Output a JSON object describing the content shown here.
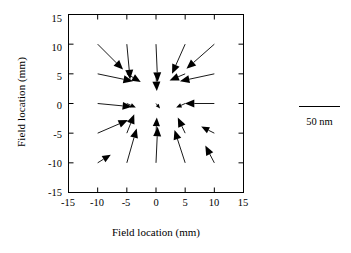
{
  "figure": {
    "xlabel": "Field location (mm)",
    "ylabel": "Field location (mm)",
    "legend_label": "50 nm",
    "frame_color": "#000000",
    "arrow_color": "#000000"
  },
  "chart_data": {
    "type": "scatter",
    "plot_kind": "quiver",
    "title": "",
    "xlabel": "Field location (mm)",
    "ylabel": "Field location (mm)",
    "xlim": [
      -15,
      15
    ],
    "ylim": [
      -15,
      15
    ],
    "xticks": [
      -15,
      -10,
      -5,
      0,
      5,
      10,
      15
    ],
    "yticks": [
      -15,
      -10,
      -5,
      0,
      5,
      10,
      15
    ],
    "xticklabels": [
      "-15",
      "-10",
      "-5",
      "0",
      "5",
      "10",
      "15"
    ],
    "yticklabels": [
      "-15",
      "-10",
      "-5",
      "0",
      "5",
      "10",
      "15"
    ],
    "grid": false,
    "legend": {
      "label": "50 nm",
      "value": 50,
      "unit": "nm",
      "position": "right-outside"
    },
    "vector_units": "nm",
    "vectors": [
      {
        "x": -10,
        "y": 10,
        "u": 3.1,
        "v": -3.1
      },
      {
        "x": -5,
        "y": 10,
        "u": 0.4,
        "v": -4.3
      },
      {
        "x": 0,
        "y": 10,
        "u": 0.2,
        "v": -4.6
      },
      {
        "x": 5,
        "y": 10,
        "u": -1.6,
        "v": -3.6
      },
      {
        "x": 10,
        "y": 10,
        "u": -3.4,
        "v": -3.0
      },
      {
        "x": -10,
        "y": 5,
        "u": 4.3,
        "v": -0.9
      },
      {
        "x": -5,
        "y": 5,
        "u": 1.7,
        "v": -1.0
      },
      {
        "x": 0,
        "y": 5,
        "u": 0.1,
        "v": -2.1
      },
      {
        "x": 5,
        "y": 5,
        "u": -1.9,
        "v": -0.8
      },
      {
        "x": 10,
        "y": 5,
        "u": -4.2,
        "v": -0.9
      },
      {
        "x": -10,
        "y": 0,
        "u": 4.2,
        "v": -0.4
      },
      {
        "x": -5,
        "y": 0,
        "u": 1.1,
        "v": -0.5
      },
      {
        "x": 0,
        "y": 0,
        "u": 0.5,
        "v": -0.6
      },
      {
        "x": 5,
        "y": 0,
        "u": -1.1,
        "v": -0.5
      },
      {
        "x": 10,
        "y": 0,
        "u": -3.6,
        "v": 0.0
      },
      {
        "x": -10,
        "y": -5,
        "u": 3.7,
        "v": 1.6
      },
      {
        "x": -5,
        "y": -5,
        "u": 0.9,
        "v": 2.3
      },
      {
        "x": 0,
        "y": -5,
        "u": 0.1,
        "v": 1.9
      },
      {
        "x": 5,
        "y": -5,
        "u": -0.9,
        "v": 1.9
      },
      {
        "x": 10,
        "y": -5,
        "u": -1.6,
        "v": 0.8
      },
      {
        "x": -10,
        "y": -10,
        "u": 1.6,
        "v": 1.0
      },
      {
        "x": -5,
        "y": -10,
        "u": 1.2,
        "v": 4.2
      },
      {
        "x": 0,
        "y": -10,
        "u": 0.2,
        "v": 4.4
      },
      {
        "x": 5,
        "y": -10,
        "u": -1.3,
        "v": 4.0
      },
      {
        "x": 10,
        "y": -10,
        "u": -1.1,
        "v": 2.1
      }
    ]
  }
}
